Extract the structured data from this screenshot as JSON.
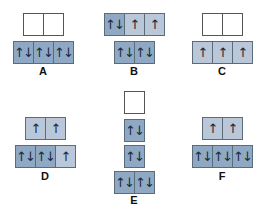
{
  "colors": {
    "paired": "#8fa9c4",
    "single": "#b9c7d8",
    "empty": "#ffffff",
    "border": "#5a6b7a"
  },
  "symbols": {
    "paired": "↑↓",
    "single": "↑",
    "empty": ""
  },
  "diagrams": [
    {
      "label": "A",
      "rows": [
        [
          "empty",
          "empty"
        ],
        [
          "paired",
          "paired",
          "paired"
        ]
      ]
    },
    {
      "label": "B",
      "rows": [
        [
          "paired",
          "single",
          "single"
        ],
        [
          "paired",
          "paired"
        ]
      ]
    },
    {
      "label": "C",
      "rows": [
        [
          "empty",
          "empty"
        ],
        [
          "single",
          "single",
          "single"
        ]
      ]
    },
    {
      "label": "D",
      "rows": [
        [
          "single",
          "single"
        ],
        [
          "paired",
          "paired",
          "single"
        ]
      ]
    },
    {
      "label": "E",
      "rows": [
        [
          "empty"
        ],
        [
          "paired"
        ],
        [
          "paired"
        ],
        [
          "paired",
          "paired"
        ]
      ]
    },
    {
      "label": "F",
      "rows": [
        [
          "single",
          "single"
        ],
        [
          "paired",
          "paired",
          "paired"
        ]
      ]
    }
  ]
}
